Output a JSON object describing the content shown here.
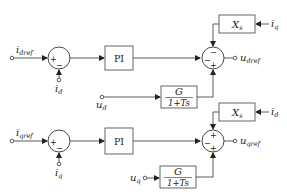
{
  "diagram": {
    "title": "",
    "colors": {
      "line": "#333333",
      "block_fill": "#ffffff",
      "block_stroke": "#555555",
      "text": "#222222"
    },
    "d_axis": {
      "input_ref": {
        "main": "i",
        "sub": "dref"
      },
      "feedback": {
        "main": "i",
        "sub": "d"
      },
      "sum1_signs": {
        "left": "+",
        "bottom": "−"
      },
      "pi_label": "PI",
      "decouple_block": {
        "main": "X",
        "sub": "s"
      },
      "decouple_input": {
        "main": "i",
        "sub": "q"
      },
      "feedforward_input": {
        "main": "u",
        "sub": "d"
      },
      "filter_num": "G",
      "filter_den": "1+Ts",
      "sum2_signs": {
        "top": "−",
        "left": "−",
        "bottom": "+"
      },
      "output": {
        "main": "u",
        "sub": "dref"
      }
    },
    "q_axis": {
      "input_ref": {
        "main": "i",
        "sub": "qref"
      },
      "feedback": {
        "main": "i",
        "sub": "q"
      },
      "sum1_signs": {
        "left": "+",
        "bottom": "−"
      },
      "pi_label": "PI",
      "decouple_block": {
        "main": "X",
        "sub": "s"
      },
      "decouple_input": {
        "main": "i",
        "sub": "d"
      },
      "feedforward_input": {
        "main": "u",
        "sub": "q"
      },
      "filter_num": "G",
      "filter_den": "1+Ts",
      "sum2_signs": {
        "top": "+",
        "left": "−",
        "bottom": "+"
      },
      "output": {
        "main": "u",
        "sub": "qref"
      }
    }
  }
}
